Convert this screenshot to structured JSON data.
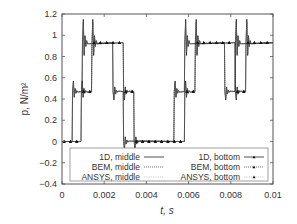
{
  "chart_data": {
    "type": "line",
    "title": "",
    "xlabel": "t, s",
    "ylabel": "p, N/m²",
    "xlim": [
      0,
      0.01
    ],
    "ylim": [
      -0.4,
      1.2
    ],
    "xticks": [
      0,
      0.002,
      0.004,
      0.006,
      0.008,
      0.01
    ],
    "xtick_labels": [
      "0",
      "0.002",
      "0.004",
      "0.006",
      "0.008",
      "0.01"
    ],
    "yticks": [
      -0.4,
      -0.2,
      0,
      0.2,
      0.4,
      0.6,
      0.8,
      1,
      1.2
    ],
    "ytick_labels": [
      "−0.4",
      "−0.2",
      "0",
      "0.2",
      "0.4",
      "0.6",
      "0.8",
      "1",
      "1.2"
    ],
    "grid": false,
    "legend_position": "lower inside, two columns",
    "series": [
      {
        "name": "1D, middle",
        "style": "solid",
        "x": [
          0,
          0.00048,
          0.0005,
          0.00095,
          0.00097,
          0.0024,
          0.00242,
          0.0029,
          0.00292,
          0.0053,
          0.00532,
          0.0058,
          0.00582,
          0.0077,
          0.00772,
          0.0082,
          0.00822,
          0.01
        ],
        "y": [
          0,
          0,
          0.47,
          0.47,
          0.93,
          0.93,
          0.47,
          0.47,
          0,
          0,
          0.47,
          0.47,
          0.93,
          0.93,
          0.47,
          0.47,
          0.93,
          0.93
        ]
      },
      {
        "name": "BEM, middle",
        "style": "dotted",
        "x": [
          0,
          0.00048,
          0.0005,
          0.00095,
          0.00097,
          0.0024,
          0.00242,
          0.0029,
          0.00292,
          0.0053,
          0.00532,
          0.0058,
          0.00582,
          0.0077,
          0.00772,
          0.0082,
          0.00822,
          0.01
        ],
        "y": [
          0,
          0,
          0.47,
          0.47,
          0.93,
          0.93,
          0.47,
          0.47,
          0,
          0,
          0.47,
          0.47,
          0.93,
          0.93,
          0.47,
          0.47,
          0.93,
          0.93
        ]
      },
      {
        "name": "ANSYS, middle",
        "style": "thin-dotted",
        "x": [
          0,
          0.00048,
          0.0005,
          0.00095,
          0.00097,
          0.0024,
          0.00242,
          0.0029,
          0.00292,
          0.0053,
          0.00532,
          0.0058,
          0.00582,
          0.0077,
          0.00772,
          0.0082,
          0.00822,
          0.01
        ],
        "y": [
          0,
          0,
          0.47,
          0.47,
          0.93,
          0.93,
          0.47,
          0.47,
          0,
          0,
          0.47,
          0.47,
          0.93,
          0.93,
          0.47,
          0.47,
          0.93,
          0.93
        ]
      },
      {
        "name": "1D, bottom",
        "style": "solid-triangle-markers",
        "x": [
          0,
          0.0009,
          0.00092,
          0.0014,
          0.00142,
          0.0029,
          0.00292,
          0.0034,
          0.00342,
          0.0058,
          0.00582,
          0.0063,
          0.00632,
          0.0082,
          0.00822,
          0.0087,
          0.00872,
          0.01
        ],
        "y": [
          0,
          0,
          0.47,
          0.47,
          0.93,
          0.93,
          0.47,
          0.47,
          0,
          0,
          0.47,
          0.47,
          0.93,
          0.93,
          0.47,
          0.47,
          0.93,
          0.93
        ]
      },
      {
        "name": "BEM, bottom",
        "style": "dotted-triangle-markers",
        "x": [
          0,
          0.0009,
          0.00092,
          0.0014,
          0.00142,
          0.0029,
          0.00292,
          0.0034,
          0.00342,
          0.0058,
          0.00582,
          0.0063,
          0.00632,
          0.0082,
          0.00822,
          0.0087,
          0.00872,
          0.01
        ],
        "y": [
          0,
          0,
          0.47,
          0.47,
          0.93,
          0.93,
          0.47,
          0.47,
          0,
          0,
          0.47,
          0.47,
          0.93,
          0.93,
          0.47,
          0.47,
          0.93,
          0.93
        ]
      },
      {
        "name": "ANSYS, bottom",
        "style": "thin-dotted-triangle-markers",
        "x": [
          0,
          0.0009,
          0.00092,
          0.0014,
          0.00142,
          0.0029,
          0.00292,
          0.0034,
          0.00342,
          0.0058,
          0.00582,
          0.0063,
          0.00632,
          0.0082,
          0.00822,
          0.0087,
          0.00872,
          0.01
        ],
        "y": [
          0,
          0,
          0.47,
          0.47,
          0.93,
          0.93,
          0.47,
          0.47,
          0,
          0,
          0.47,
          0.47,
          0.93,
          0.93,
          0.47,
          0.47,
          0.93,
          0.93
        ]
      }
    ],
    "annotations": "Overshoot spikes up to ~1.15 at rises to 0.93 and ~0.57 at rises to 0.47; undershoot to ~-0.08 at drops to 0"
  },
  "legend": {
    "left": [
      "1D, middle",
      "BEM, middle",
      "ANSYS, middle"
    ],
    "right": [
      "1D, bottom",
      "BEM, bottom",
      "ANSYS, bottom"
    ]
  },
  "colors": {
    "axis": "#555555",
    "line": "#222222",
    "text": "#333333"
  }
}
